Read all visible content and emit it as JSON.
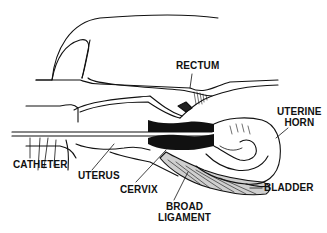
{
  "diagram": {
    "type": "anatomical-line-drawing",
    "labels": {
      "rectum": "RECTUM",
      "uterine_horn_1": "UTERINE",
      "uterine_horn_2": "HORN",
      "catheter": "CATHETER",
      "uterus": "UTERUS",
      "cervix": "CERVIX",
      "broad_ligament_1": "BROAD",
      "broad_ligament_2": "LIGAMENT",
      "bladder": "BLADDER"
    },
    "colors": {
      "ink": "#111111",
      "background": "#ffffff"
    }
  }
}
